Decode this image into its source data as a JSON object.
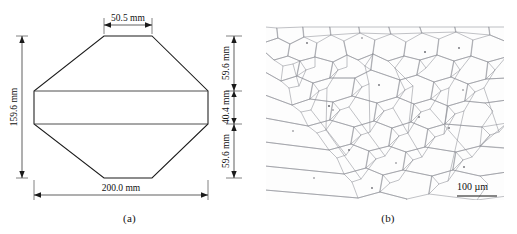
{
  "figure": {
    "panels": [
      {
        "id": "a",
        "caption": "(a)",
        "type": "engineering-drawing",
        "description": "Octagonal billet cross-section with dimension callouts"
      },
      {
        "id": "b",
        "caption": "(b)",
        "type": "micrograph",
        "description": "Optical micrograph of equiaxed grain structure"
      }
    ]
  },
  "drawing": {
    "dimensions": {
      "top_width": "50.5 mm",
      "overall_height": "159.6 mm",
      "overall_width": "200.0 mm",
      "right_upper": "59.6 mm",
      "right_middle": "40.4 mm",
      "right_lower": "59.6 mm"
    },
    "units": "mm",
    "geometry": {
      "top_flat_mm": 50.5,
      "bottom_flat_mm": 50.5,
      "total_width_mm": 200.0,
      "total_height_mm": 159.6,
      "side_segments_mm": [
        59.6,
        40.4,
        59.6
      ]
    }
  },
  "micrograph": {
    "scale_bar_label": "100 µm",
    "scale_bar_length_um": 100,
    "background_color": "#fdfdfd",
    "grain_boundary_color": "#8e8f96"
  },
  "colors": {
    "page_background": "#ffffff",
    "line": "#1b1b1b",
    "inner_line": "#3a3a3a",
    "text": "#111111"
  }
}
